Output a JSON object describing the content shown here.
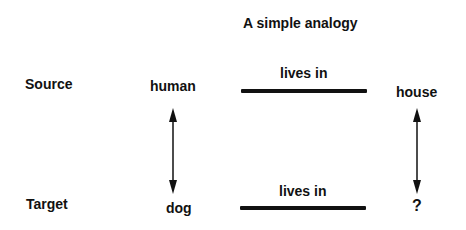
{
  "diagram": {
    "title": "A simple analogy",
    "rows": {
      "source": {
        "label": "Source",
        "subject": "human",
        "relation": "lives in",
        "object": "house"
      },
      "target": {
        "label": "Target",
        "subject": "dog",
        "relation": "lives in",
        "object": "?"
      }
    },
    "mappings": [
      {
        "from": "human",
        "to": "dog",
        "type": "double-arrow"
      },
      {
        "from": "house",
        "to": "?",
        "type": "double-arrow"
      }
    ],
    "colors": {
      "ink": "#111111",
      "background": "#ffffff"
    }
  }
}
